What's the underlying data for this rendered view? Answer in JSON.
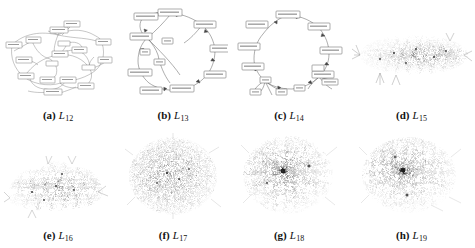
{
  "figure": {
    "type": "graph-visualization-grid",
    "rows": 2,
    "columns": 4,
    "background_color": "#ffffff",
    "ink_color": "#4a4a4a"
  },
  "panels": [
    {
      "id": "panel-a",
      "tag": "(a)",
      "label_base": "L",
      "label_sub": "12",
      "layout": "sparse-labeled-node-link",
      "node_style": "labeled-rectangle",
      "density": "low",
      "shape": "wide-irregular-with-loops"
    },
    {
      "id": "panel-b",
      "tag": "(b)",
      "label_base": "L",
      "label_sub": "13",
      "layout": "ring-cycle",
      "node_style": "labeled-rectangle",
      "density": "very-low",
      "shape": "circular-ring"
    },
    {
      "id": "panel-c",
      "tag": "(c)",
      "label_base": "L",
      "label_sub": "14",
      "layout": "ring-cycle",
      "node_style": "labeled-rectangle",
      "density": "very-low",
      "shape": "circular-ring-with-cluster"
    },
    {
      "id": "panel-d",
      "tag": "(d)",
      "label_base": "L",
      "label_sub": "15",
      "layout": "force-directed",
      "node_style": "dot",
      "density": "medium",
      "shape": "wide-flat-mesh"
    },
    {
      "id": "panel-e",
      "tag": "(e)",
      "label_base": "L",
      "label_sub": "16",
      "layout": "force-directed",
      "node_style": "dot",
      "density": "medium",
      "shape": "irregular-mesh"
    },
    {
      "id": "panel-f",
      "tag": "(f)",
      "label_base": "L",
      "label_sub": "17",
      "layout": "force-directed",
      "node_style": "dot",
      "density": "high",
      "shape": "round-hairball"
    },
    {
      "id": "panel-g",
      "tag": "(g)",
      "label_base": "L",
      "label_sub": "18",
      "layout": "force-directed",
      "node_style": "dot",
      "density": "very-high",
      "shape": "round-hairball-with-dark-core"
    },
    {
      "id": "panel-h",
      "tag": "(h)",
      "label_base": "L",
      "label_sub": "19",
      "layout": "force-directed",
      "node_style": "dot",
      "density": "very-high",
      "shape": "round-hairball-with-dark-core"
    }
  ]
}
